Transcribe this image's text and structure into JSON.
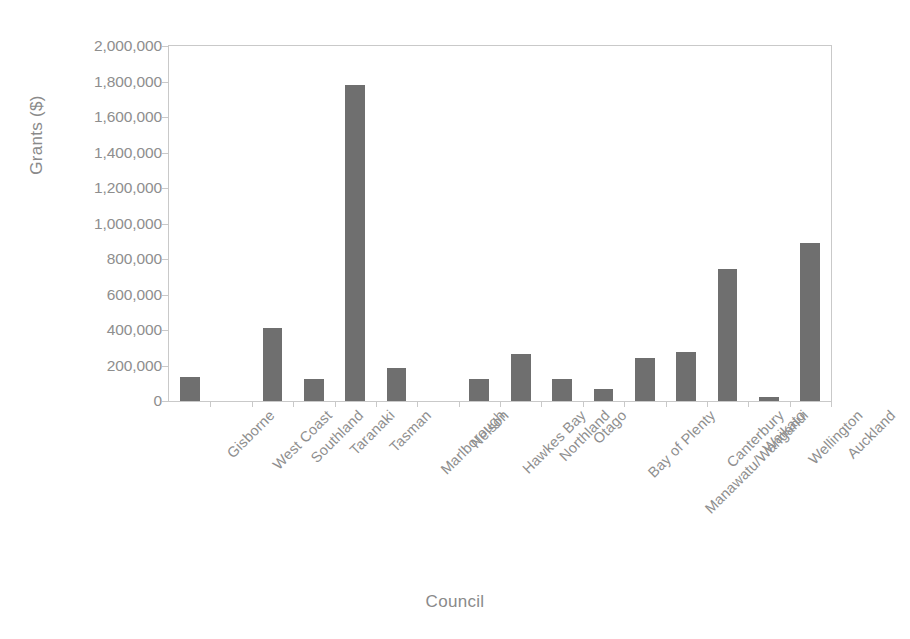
{
  "chart_data": {
    "type": "bar",
    "title": "",
    "xlabel": "Council",
    "ylabel": "Grants ($)",
    "categories": [
      "Gisborne",
      "West Coast",
      "Southland",
      "Taranaki",
      "Tasman",
      "Marlborough",
      "Nelson",
      "Hawkes Bay",
      "Northland",
      "Otago",
      "Bay of Plenty",
      "Manawatu/Wanganui",
      "Canterbury",
      "Waikato",
      "Wellington",
      "Auckland"
    ],
    "values": [
      135000,
      0,
      410000,
      125000,
      1780000,
      185000,
      0,
      125000,
      265000,
      125000,
      65000,
      245000,
      275000,
      745000,
      25000,
      890000
    ],
    "ylim": [
      0,
      2000000
    ],
    "ytick_values": [
      0,
      200000,
      400000,
      600000,
      800000,
      1000000,
      1200000,
      1400000,
      1600000,
      1800000,
      2000000
    ],
    "ytick_labels": [
      "0",
      "200,000",
      "400,000",
      "600,000",
      "800,000",
      "1,000,000",
      "1,200,000",
      "1,400,000",
      "1,600,000",
      "1,800,000",
      "2,000,000"
    ],
    "grid": false,
    "legend": false,
    "bar_color": "#6f6f6f",
    "axis_color": "#c9c9c9",
    "text_color": "#8e8e8e",
    "background": "#ffffff"
  }
}
